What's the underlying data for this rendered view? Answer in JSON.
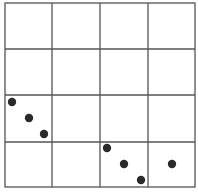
{
  "diagram": {
    "type": "grid-with-dots",
    "rows": 4,
    "cols": 4,
    "grid_color": "#555555",
    "dot_color": "#2a2a2a",
    "dots": [
      {
        "cell": [
          2,
          0
        ],
        "x": 12,
        "y": 102
      },
      {
        "cell": [
          2,
          0
        ],
        "x": 29,
        "y": 118
      },
      {
        "cell": [
          2,
          0
        ],
        "x": 44,
        "y": 134
      },
      {
        "cell": [
          3,
          2
        ],
        "x": 107,
        "y": 148
      },
      {
        "cell": [
          3,
          2
        ],
        "x": 124,
        "y": 164
      },
      {
        "cell": [
          3,
          2
        ],
        "x": 141,
        "y": 180
      },
      {
        "cell": [
          3,
          3
        ],
        "x": 172,
        "y": 164
      }
    ]
  }
}
